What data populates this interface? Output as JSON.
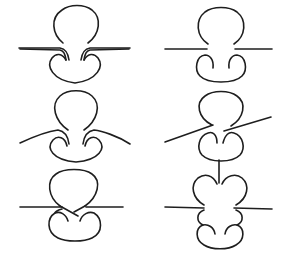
{
  "diagram": {
    "type": "knot-tangle-moves",
    "layout": {
      "rows": 3,
      "cols": 2
    },
    "stroke_color": "#1e1e1e",
    "background": "#ffffff",
    "panels": [
      {
        "id": "p1",
        "row": 1,
        "col": 1,
        "description": "Loop above horizontal strand; lower lobes curl inward with doubled strands touching the line"
      },
      {
        "id": "p2",
        "row": 1,
        "col": 2,
        "description": "Loop above horizontal strand with gaps (crossings); lower lobes curl inward"
      },
      {
        "id": "p3",
        "row": 2,
        "col": 1,
        "description": "Strand bends down at both ends, passing tangentially around the lobes"
      },
      {
        "id": "p4",
        "row": 2,
        "col": 2,
        "description": "Tilted strand crossing between loop and lobes with breaks"
      },
      {
        "id": "p5",
        "row": 3,
        "col": 1,
        "description": "Horizontal strand with X-shaped crossing strands between loop and lobes"
      },
      {
        "id": "p6",
        "row": 3,
        "col": 2,
        "description": "Vertical stem into heart-shaped lobes above strand; twisted lower lobes below"
      }
    ]
  }
}
